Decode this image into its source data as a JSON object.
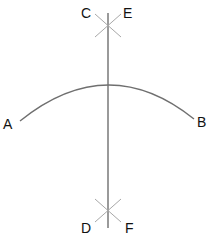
{
  "diagram": {
    "colors": {
      "stroke": "#6f6f6f",
      "construction": "#a8a8a8",
      "label": "#111111",
      "background": "#ffffff"
    },
    "labels": {
      "A": "A",
      "B": "B",
      "C": "C",
      "D": "D",
      "E": "E",
      "F": "F"
    }
  }
}
